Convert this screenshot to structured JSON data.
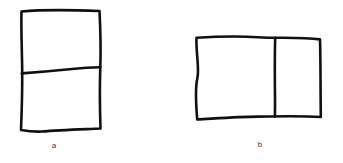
{
  "figure": {
    "background_color": "#ffffff",
    "ink_color": "#101010",
    "caption_color": "#3a3a3a",
    "style": "hand-drawn-sketch",
    "panels": [
      {
        "id": "a",
        "label": "a",
        "shape": "rectangle",
        "orientation": "portrait",
        "division": "horizontal-line",
        "parts": 2,
        "outline_path": "M21.5,11.5 C40,9.8 62,9.6 99.5,11.0 C100.6,32 100.9,52 100.2,70.5 C99.6,90 99.9,110 100.5,128.5 C80,129.4 60,130.0 41.5,131.5 C34,131.9 27,131.0 21.0,130.0 C21.8,110 22.4,90 22.2,70.5 C22.0,50 21.0,31 21.5,11.5 Z",
        "divider_path": "M21.8,73.4 C38,72.2 56,70.6 72,69.0 C82,68.0 92,67.4 100.3,67.2"
      },
      {
        "id": "b",
        "label": "b",
        "shape": "rectangle",
        "orientation": "landscape",
        "division": "vertical-line",
        "parts": 2,
        "outline_path": "M196.5,37.8 C215,36.6 238,36.0 258,37.2 C278,38.4 300,37.0 320.0,39.4 C320.6,58 320.4,78 320.8,117.0 C300,115.8 278,116.4 258,116.6 C238,116.8 216,118.4 197.2,119.4 C195.6,100 195.0,88 197.4,78.0 C199.6,68 195.8,53 196.5,37.8 Z",
        "divider_path": "M275.2,38.0 C274.6,58 274.8,78 275.0,96.0 C275.1,104 275.0,111 274.9,116.6"
      }
    ]
  }
}
